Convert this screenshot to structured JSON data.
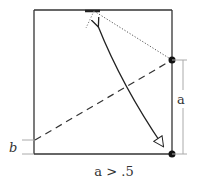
{
  "diagram": {
    "labels": {
      "a": "a",
      "b": "b",
      "caption": "a > .5"
    },
    "colors": {
      "stroke": "#222222",
      "guide": "#aaaaaa",
      "dotted": "#555555"
    }
  }
}
